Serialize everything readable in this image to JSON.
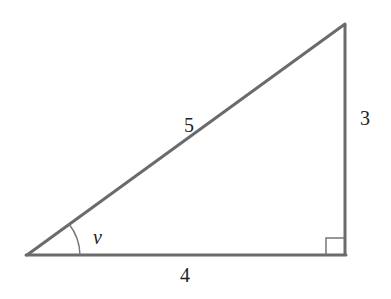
{
  "diagram": {
    "type": "right-triangle",
    "stroke_color": "#6b6b6b",
    "sides": {
      "hypotenuse": "5",
      "vertical": "3",
      "base": "4"
    },
    "angle_label": "v",
    "right_angle_marker": true
  }
}
